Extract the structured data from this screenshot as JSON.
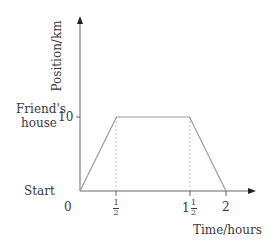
{
  "chart_data": {
    "type": "line",
    "title": "",
    "xlabel": "Time/hours",
    "ylabel": "Position/km",
    "x": [
      0,
      0.5,
      1.5,
      2
    ],
    "series": [
      {
        "name": "journey",
        "values": [
          0,
          10,
          10,
          0
        ]
      }
    ],
    "xticks": [
      "0",
      "1/2",
      "1 1/2",
      "2"
    ],
    "yticks": [
      "10"
    ],
    "y_annotations": [
      {
        "value": 0,
        "text": "Start"
      },
      {
        "value": 10,
        "text": "Friend's house"
      }
    ],
    "reference_lines": [
      {
        "type": "vertical-dashed",
        "x": 0.5
      },
      {
        "type": "vertical-dashed",
        "x": 1.5
      }
    ],
    "xlim": [
      0,
      2.2
    ],
    "ylim": [
      0,
      13.3
    ],
    "grid": false,
    "line_color": "#999999",
    "axis_color": "#555555"
  },
  "labels": {
    "ylabel": "Position/km",
    "xlabel": "Time/hours",
    "start": "Start",
    "friends_line1": "Friend's",
    "friends_line2": "house",
    "y10": "10",
    "x0": "0",
    "half_num": "1",
    "half_den": "2",
    "one": "1",
    "x2": "2"
  }
}
